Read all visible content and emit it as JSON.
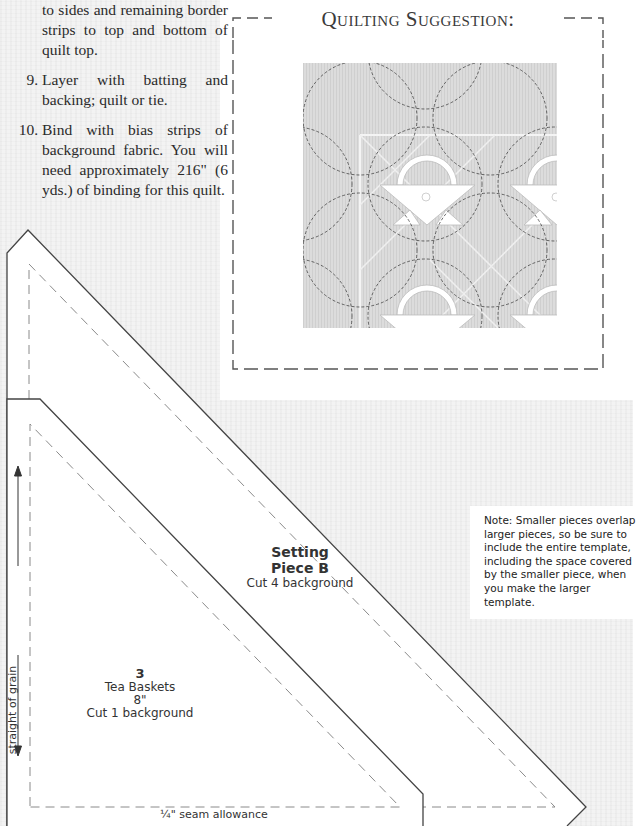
{
  "instructions": {
    "continuation": "to sides and remaining border strips to top and bottom of quilt top.",
    "steps": [
      {
        "number": "9.",
        "text": "Layer with batting and backing; quilt or tie."
      },
      {
        "number": "10.",
        "text": "Bind with bias strips of background fabric. You will need approximately  216\" (6 yds.) of binding for this quilt."
      }
    ]
  },
  "quilting_suggestion": {
    "title": "Quilting Suggestion:"
  },
  "templates": {
    "setting_piece": {
      "title_line1": "Setting",
      "title_line2": "Piece B",
      "cut": "Cut 4 background"
    },
    "basket_piece": {
      "number": "3",
      "name": "Tea Baskets",
      "size": "8\"",
      "cut": "Cut 1 background"
    },
    "grain_label": "straight of grain",
    "seam_label": "¼\" seam allowance"
  },
  "note": "Note: Smaller pieces overlap larger pieces, so be sure to include the entire template, including the space covered by the smaller piece, when you make the larger template.",
  "colors": {
    "outline": "#444444",
    "dash": "#8a8a8a",
    "quilt_fill": "#d9d9d9",
    "background": "#f3f3f3"
  }
}
